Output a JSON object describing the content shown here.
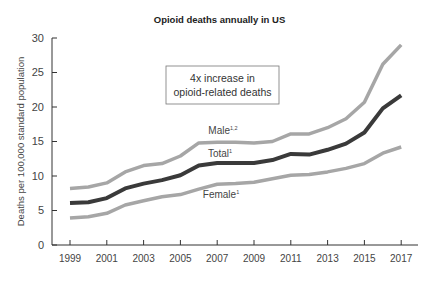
{
  "chart_data": {
    "type": "line",
    "title": "Opioid deaths annually in US",
    "xlabel": "",
    "ylabel": "Deaths per 100,000 standard population",
    "ylim": [
      0,
      30
    ],
    "yticks": [
      0,
      5,
      10,
      15,
      20,
      25,
      30
    ],
    "xticks": [
      "1999",
      "2001",
      "2003",
      "2005",
      "2007",
      "2009",
      "2011",
      "2013",
      "2015",
      "2017"
    ],
    "grid": false,
    "x": [
      1999,
      2000,
      2001,
      2002,
      2003,
      2004,
      2005,
      2006,
      2007,
      2008,
      2009,
      2010,
      2011,
      2012,
      2013,
      2014,
      2015,
      2016,
      2017
    ],
    "series": [
      {
        "name": "Male",
        "label": "Male",
        "superscript": "1,2",
        "color": "#a6a6a6",
        "values": [
          8.2,
          8.4,
          9.0,
          10.6,
          11.5,
          11.8,
          12.9,
          14.8,
          14.9,
          14.9,
          14.8,
          15.0,
          16.1,
          16.1,
          17.0,
          18.3,
          20.7,
          26.2,
          29.0
        ]
      },
      {
        "name": "Total",
        "label": "Total",
        "superscript": "1",
        "color": "#3a3a3a",
        "values": [
          6.1,
          6.2,
          6.8,
          8.2,
          8.9,
          9.4,
          10.1,
          11.5,
          11.9,
          11.9,
          11.9,
          12.3,
          13.2,
          13.1,
          13.8,
          14.7,
          16.3,
          19.8,
          21.7
        ]
      },
      {
        "name": "Female",
        "label": "Female",
        "superscript": "1",
        "color": "#a6a6a6",
        "values": [
          3.9,
          4.1,
          4.6,
          5.8,
          6.4,
          7.0,
          7.3,
          8.1,
          8.8,
          8.9,
          9.1,
          9.6,
          10.1,
          10.2,
          10.6,
          11.1,
          11.8,
          13.3,
          14.2
        ]
      }
    ],
    "annotation": {
      "line1": "4x increase in",
      "line2": "opioid-related deaths"
    }
  }
}
